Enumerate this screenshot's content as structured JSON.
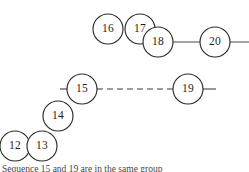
{
  "figure": {
    "background_color": "#ffffff",
    "stroke_color": "#2b2b2b",
    "edge_color": "#4a4a4a",
    "label_color": "#1f1f1f",
    "width": 249,
    "height": 172,
    "node_radius": 15
  },
  "nodes": [
    {
      "id": "n16",
      "label": "16",
      "cx": 108,
      "cy": 29
    },
    {
      "id": "n17",
      "label": "17",
      "cx": 140,
      "cy": 29
    },
    {
      "id": "n18",
      "label": "18",
      "cx": 158,
      "cy": 42
    },
    {
      "id": "n20",
      "label": "20",
      "cx": 215,
      "cy": 42
    },
    {
      "id": "n15",
      "label": "15",
      "cx": 82,
      "cy": 89
    },
    {
      "id": "n19",
      "label": "19",
      "cx": 188,
      "cy": 89
    },
    {
      "id": "n14",
      "label": "14",
      "cx": 58,
      "cy": 116
    },
    {
      "id": "n12",
      "label": "12",
      "cx": 15,
      "cy": 146
    },
    {
      "id": "n13",
      "label": "13",
      "cx": 42,
      "cy": 146
    }
  ],
  "edges": [
    {
      "id": "e-18-20",
      "style": "solid",
      "x1": 143,
      "y1": 42,
      "x2": 249,
      "y2": 42
    },
    {
      "id": "e-15-19-left-stub",
      "style": "solid",
      "x1": 60,
      "y1": 89,
      "x2": 82,
      "y2": 89
    },
    {
      "id": "e-15-19-dashed",
      "style": "dashed",
      "x1": 97,
      "y1": 89,
      "x2": 173,
      "y2": 89
    },
    {
      "id": "e-19-right-stub",
      "style": "solid",
      "x1": 188,
      "y1": 89,
      "x2": 216,
      "y2": 89
    }
  ],
  "caption": {
    "text": "Sequence 15 and 19 are in the same group"
  }
}
